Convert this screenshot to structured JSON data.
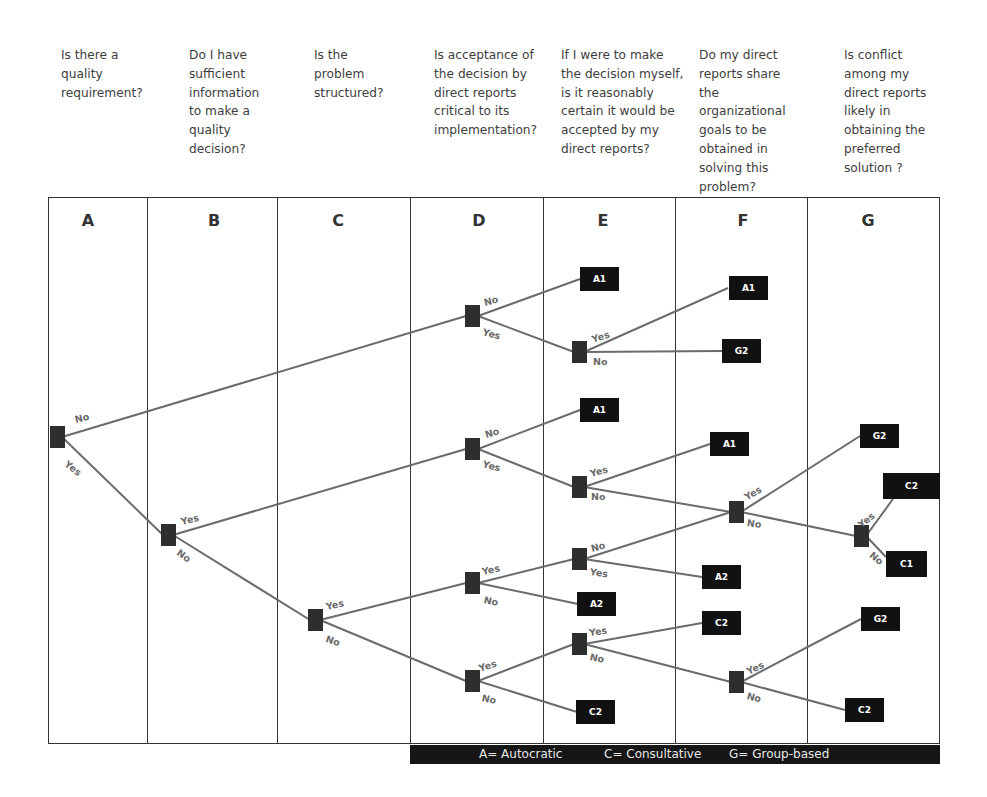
{
  "questions": [
    {
      "col": "A",
      "text": "Is there a\nquality\nrequirement?"
    },
    {
      "col": "B",
      "text": "Do I have\nsufficient\ninformation\nto make a\nquality\ndecision?"
    },
    {
      "col": "C",
      "text": "Is the\nproblem\nstructured?"
    },
    {
      "col": "D",
      "text": "Is acceptance of\nthe decision by\ndirect reports\ncritical to its\nimplementation?"
    },
    {
      "col": "E",
      "text": "If I were to make\nthe decision myself,\nis it reasonably\ncertain it would be\naccepted by my\ndirect reports?"
    },
    {
      "col": "F",
      "text": "Do my direct\nreports share\nthe\norganizational\ngoals to be\nobtained in\nsolving this\nproblem?"
    },
    {
      "col": "G",
      "text": "Is conflict\namong my\ndirect reports\nlikely in\nobtaining the\npreferred\nsolution ?"
    }
  ],
  "columns": [
    "A",
    "B",
    "C",
    "D",
    "E",
    "F",
    "G"
  ],
  "leaves": [
    "A1",
    "G2",
    "A1",
    "A1",
    "A1",
    "G2",
    "C2",
    "C1",
    "A2",
    "A2",
    "C2",
    "G2",
    "C2",
    "C2"
  ],
  "branch_labels": {
    "yes": "Yes",
    "no": "No"
  },
  "legend": {
    "autocratic": "A= Autocratic",
    "consultative": "C= Consultative",
    "group": "G= Group-based"
  },
  "colors": {
    "line": "#6b6b6b",
    "node": "#2e2e2e",
    "leaf": "#111111",
    "legend_bg": "#161616"
  }
}
